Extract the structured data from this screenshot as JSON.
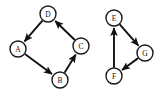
{
  "figure": {
    "type": "directed-graph",
    "background_color": "#ffffff",
    "stroke_color": "#111111",
    "node_fill_color": "#ffffff",
    "node_radius": 8,
    "components": [
      {
        "id": "left-component",
        "name": "cycle-abcd",
        "nodes": [
          {
            "id": "A",
            "label": "A",
            "cx": 18,
            "cy": 49
          },
          {
            "id": "B",
            "label": "B",
            "cx": 60,
            "cy": 80
          },
          {
            "id": "C",
            "label": "C",
            "cx": 81,
            "cy": 46
          },
          {
            "id": "D",
            "label": "D",
            "cx": 48,
            "cy": 14
          }
        ],
        "edges": [
          {
            "id": "D-A",
            "from": "D",
            "to": "A",
            "directed": true
          },
          {
            "id": "A-B",
            "from": "A",
            "to": "B",
            "directed": true
          },
          {
            "id": "B-C",
            "from": "B",
            "to": "C",
            "directed": true
          },
          {
            "id": "C-D",
            "from": "C",
            "to": "D",
            "directed": true
          }
        ]
      },
      {
        "id": "right-component",
        "name": "cycle-efg",
        "nodes": [
          {
            "id": "E",
            "label": "E",
            "cx": 114,
            "cy": 18
          },
          {
            "id": "F",
            "label": "F",
            "cx": 114,
            "cy": 76
          },
          {
            "id": "G",
            "label": "G",
            "cx": 145,
            "cy": 53
          }
        ],
        "edges": [
          {
            "id": "E-G",
            "from": "E",
            "to": "G",
            "directed": true
          },
          {
            "id": "G-F",
            "from": "G",
            "to": "F",
            "directed": true
          },
          {
            "id": "F-E",
            "from": "F",
            "to": "E",
            "directed": true
          }
        ]
      }
    ]
  }
}
